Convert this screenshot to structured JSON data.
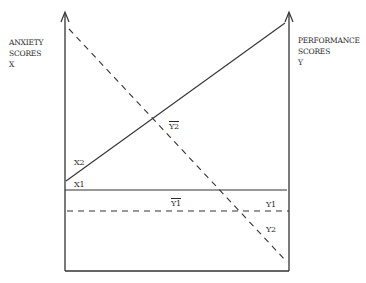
{
  "diagram": {
    "left_axis": {
      "label_line1": "ANXIETY",
      "label_line2": "SCORES",
      "label_line3": "X"
    },
    "right_axis": {
      "label_line1": "PERFORMANCE",
      "label_line2": "SCORES",
      "label_line3": "Y"
    },
    "labels": {
      "x2": "X2",
      "x1": "X1",
      "y1_mean": "Y1",
      "y2_mean": "Y2",
      "y1": "Y1",
      "y2": "Y2"
    },
    "colors": {
      "line": "#333333",
      "background": "#ffffff"
    }
  }
}
